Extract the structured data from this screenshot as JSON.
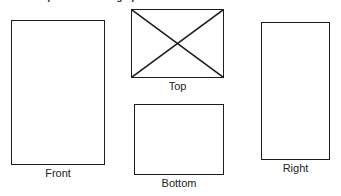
{
  "document": {
    "title": "Complete the Orthographic Sketch: Part A — Extra",
    "background_color": "#ffffff",
    "line_color": "#1c1c1c",
    "text_color": "#232323"
  },
  "views": {
    "front": {
      "label": "Front",
      "shape": "rectangle",
      "has_diagonals": false,
      "x": 11,
      "y": 20,
      "width": 94,
      "height": 145
    },
    "top": {
      "label": "Top",
      "shape": "rectangle-with-x-diagonals",
      "has_diagonals": true,
      "x": 131,
      "y": 9,
      "width": 93,
      "height": 69
    },
    "bottom": {
      "label": "Bottom",
      "shape": "rectangle",
      "has_diagonals": false,
      "x": 134,
      "y": 104,
      "width": 90,
      "height": 71
    },
    "right": {
      "label": "Right",
      "shape": "rectangle",
      "has_diagonals": false,
      "x": 261,
      "y": 22,
      "width": 69,
      "height": 138
    }
  }
}
